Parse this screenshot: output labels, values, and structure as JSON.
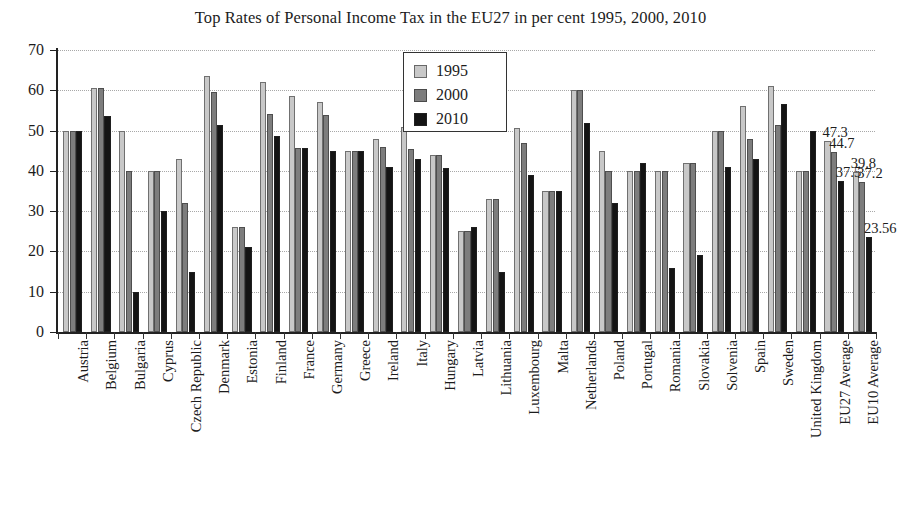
{
  "chart_data": {
    "type": "bar",
    "title": "Top Rates of Personal Income Tax in the EU27 in per cent 1995, 2000, 2010",
    "xlabel": "",
    "ylabel": "",
    "ylim": [
      0,
      70
    ],
    "ytick_step": 10,
    "yticks": [
      0,
      10,
      20,
      30,
      40,
      50,
      60,
      70
    ],
    "grid": true,
    "legend_position": "top-center",
    "categories": [
      "Austria",
      "Belgium",
      "Bulgaria",
      "Cyprus",
      "Czech Republic",
      "Denmark",
      "Estonia",
      "Finland",
      "France",
      "Germany",
      "Greece",
      "Ireland",
      "Italy",
      "Hungary",
      "Latvia",
      "Lithuania",
      "Luxembourg",
      "Malta",
      "Netherlands",
      "Poland",
      "Portugal",
      "Romania",
      "Slovakia",
      "Solvenia",
      "Spain",
      "Sweden",
      "United Kingdom",
      "EU27 Average",
      "EU10 Average"
    ],
    "series": [
      {
        "name": "1995",
        "color": "#c8c8c8",
        "values": [
          50.0,
          60.6,
          50.0,
          40.0,
          43.0,
          63.5,
          26.0,
          62.0,
          58.7,
          57.0,
          45.0,
          48.0,
          51.0,
          44.0,
          25.0,
          33.0,
          50.6,
          35.0,
          60.0,
          45.0,
          40.0,
          40.0,
          42.0,
          50.0,
          56.0,
          61.0,
          40.0,
          47.3,
          39.8
        ]
      },
      {
        "name": "2000",
        "color": "#7d7d7d",
        "values": [
          50.0,
          60.6,
          40.0,
          40.0,
          32.0,
          59.7,
          26.0,
          54.0,
          45.8,
          53.8,
          45.0,
          46.0,
          45.5,
          44.0,
          25.0,
          33.0,
          47.0,
          35.0,
          60.0,
          40.0,
          40.0,
          40.0,
          42.0,
          50.0,
          48.0,
          51.5,
          40.0,
          44.7,
          37.2
        ]
      },
      {
        "name": "2010",
        "color": "#141414",
        "values": [
          50.0,
          53.7,
          10.0,
          30.0,
          15.0,
          51.5,
          21.0,
          48.6,
          45.8,
          45.0,
          45.0,
          41.0,
          43.0,
          40.6,
          26.0,
          15.0,
          39.0,
          35.0,
          52.0,
          32.0,
          42.0,
          16.0,
          19.0,
          41.0,
          43.0,
          56.5,
          50.0,
          37.5,
          23.56
        ]
      }
    ],
    "value_labels": [
      {
        "text": "47.3",
        "category": "EU27 Average",
        "series": "1995"
      },
      {
        "text": "44.7",
        "category": "EU27 Average",
        "series": "2000"
      },
      {
        "text": "37.5",
        "category": "EU27 Average",
        "series": "2010"
      },
      {
        "text": "39.8",
        "category": "EU10 Average",
        "series": "1995"
      },
      {
        "text": "37.2",
        "category": "EU10 Average",
        "series": "2000"
      },
      {
        "text": "23.56",
        "category": "EU10 Average",
        "series": "2010"
      }
    ]
  }
}
